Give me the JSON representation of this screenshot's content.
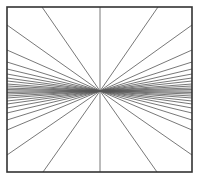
{
  "figure": {
    "type": "radiating-lines-illusion",
    "frame": {
      "x1": 7,
      "y1": 7,
      "x2": 192,
      "y2": 172,
      "stroke": "#333333",
      "width": 1.6
    },
    "center": {
      "x": 100,
      "y": 91
    },
    "line_color": "#555555",
    "line_width": 0.8,
    "left_edge_y": [
      25,
      50,
      62,
      69,
      74,
      78,
      81,
      84,
      86,
      88,
      89.5,
      91,
      92.5,
      94,
      96,
      98,
      101,
      104,
      108,
      113,
      120,
      130,
      155
    ],
    "right_edge_y": [
      25,
      50,
      62,
      69,
      74,
      78,
      81,
      84,
      86,
      88,
      89.5,
      91,
      92.5,
      94,
      96,
      98,
      101,
      104,
      108,
      113,
      120,
      130,
      155
    ],
    "top_edge_x": [
      42,
      100,
      158
    ],
    "bottom_edge_x": [
      43,
      100,
      157
    ]
  }
}
